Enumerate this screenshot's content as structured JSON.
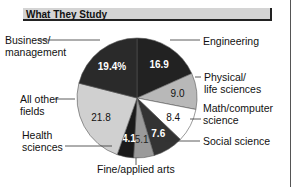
{
  "header": {
    "title": "What They Study"
  },
  "chart_data": {
    "type": "pie",
    "title": "What They Study",
    "unit": "%",
    "slices": [
      {
        "label": "Engineering",
        "value": 16.9,
        "display": "16.9",
        "color": "#222222",
        "text_color": "#ffffff"
      },
      {
        "label": "Physical/ life sciences",
        "value": 9.0,
        "display": "9.0",
        "color": "#b8b8b8",
        "text_color": "#111111"
      },
      {
        "label": "Math/computer science",
        "value": 8.4,
        "display": "8.4",
        "color": "#ffffff",
        "text_color": "#111111"
      },
      {
        "label": "Social science",
        "value": 7.6,
        "display": "7.6",
        "color": "#333333",
        "text_color": "#ffffff"
      },
      {
        "label": "Fine/applied arts",
        "value": 5.1,
        "display": "5.1",
        "color": "#9a9a9a",
        "text_color": "#222222"
      },
      {
        "label": "Health sciences",
        "value": 4.1,
        "display": "4.1",
        "color": "#1a1a1a",
        "text_color": "#ffffff"
      },
      {
        "label": "All other fields",
        "value": 21.8,
        "display": "21.8",
        "color": "#d0d0d0",
        "text_color": "#111111"
      },
      {
        "label": "Business/ management",
        "value": 19.4,
        "display": "19.4%",
        "color": "#2a2a2a",
        "text_color": "#ffffff"
      }
    ]
  },
  "labels": {
    "business_1": "Business/",
    "business_2": "management",
    "engineering": "Engineering",
    "physical_1": "Physical/",
    "physical_2": "life sciences",
    "math_1": "Math/computer",
    "math_2": "science",
    "social": "Social science",
    "fine": "Fine/applied arts",
    "health_1": "Health",
    "health_2": "sciences",
    "other_1": "All other",
    "other_2": "fields"
  }
}
